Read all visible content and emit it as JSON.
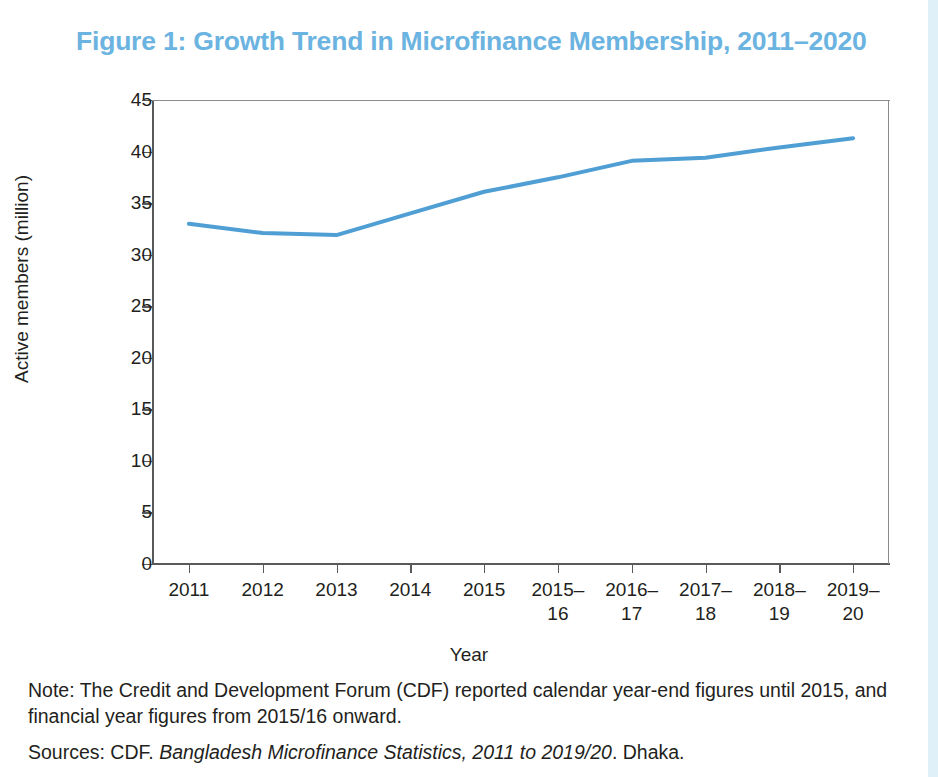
{
  "figure": {
    "title": "Figure 1: Growth Trend in Microfinance Membership, 2011–2020",
    "title_color": "#6bb3e0",
    "line_color": "#4f9ed4"
  },
  "notes": {
    "note_label": "Note:",
    "note_text": "Note: The Credit and Development Forum (CDF) reported calendar year-end figures until 2015, and financial year figures from 2015/16 onward.",
    "sources_prefix": "Sources: CDF. ",
    "sources_italic": "Bangladesh Microfinance Statistics, 2011 to 2019/20",
    "sources_suffix": ". Dhaka."
  },
  "chart_data": {
    "type": "line",
    "title": "Figure 1: Growth Trend in Microfinance Membership, 2011–2020",
    "xlabel": "Year",
    "ylabel": "Active members (million)",
    "categories": [
      "2011",
      "2012",
      "2013",
      "2014",
      "2015",
      "2015–16",
      "2016–17",
      "2017–18",
      "2018–19",
      "2019–20"
    ],
    "values": [
      33.0,
      32.1,
      31.9,
      34.0,
      36.1,
      37.5,
      39.1,
      39.4,
      40.4,
      41.3
    ],
    "series": [
      {
        "name": "Active members (million)",
        "values": [
          33.0,
          32.1,
          31.9,
          34.0,
          36.1,
          37.5,
          39.1,
          39.4,
          40.4,
          41.3
        ],
        "color": "#4f9ed4"
      }
    ],
    "yticks": [
      0,
      5,
      10,
      15,
      20,
      25,
      30,
      35,
      40,
      45
    ],
    "ytick_labels": [
      "0",
      "5",
      "10",
      "15",
      "20",
      "25",
      "30",
      "35",
      "40",
      "45"
    ],
    "ylim": [
      0,
      45
    ],
    "grid": false,
    "legend": "none",
    "markers": false,
    "line_width": 4
  }
}
